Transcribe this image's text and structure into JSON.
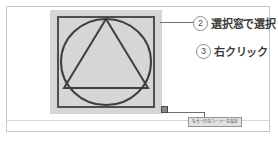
{
  "figure": {
    "type": "cad-instruction-diagram",
    "background_color": "#ffffff",
    "frame_border_color": "#c9c9c9"
  },
  "canvas": {
    "name": "selection-window",
    "fill_color": "#d6d6d6",
    "stroke_color": "#4f4f4f",
    "shapes": [
      {
        "name": "inner-square",
        "type": "square"
      },
      {
        "name": "inscribed-circle",
        "type": "circle"
      },
      {
        "name": "inscribed-triangle",
        "type": "triangle"
      }
    ]
  },
  "handle": {
    "name": "corner-grip-handle",
    "fill_color": "#8a8a8a",
    "border_color": "#4a4a4a"
  },
  "callouts": [
    {
      "id": "select-window",
      "number": "2",
      "text": "選択窓で選択"
    },
    {
      "id": "right-click",
      "number": "3",
      "text": "右クリック"
    }
  ],
  "tooltip": {
    "name": "command-prompt-tooltip",
    "text": "もう一方のコーナーを指定",
    "background_color": "#e2e2e2",
    "border_color": "#949494"
  }
}
